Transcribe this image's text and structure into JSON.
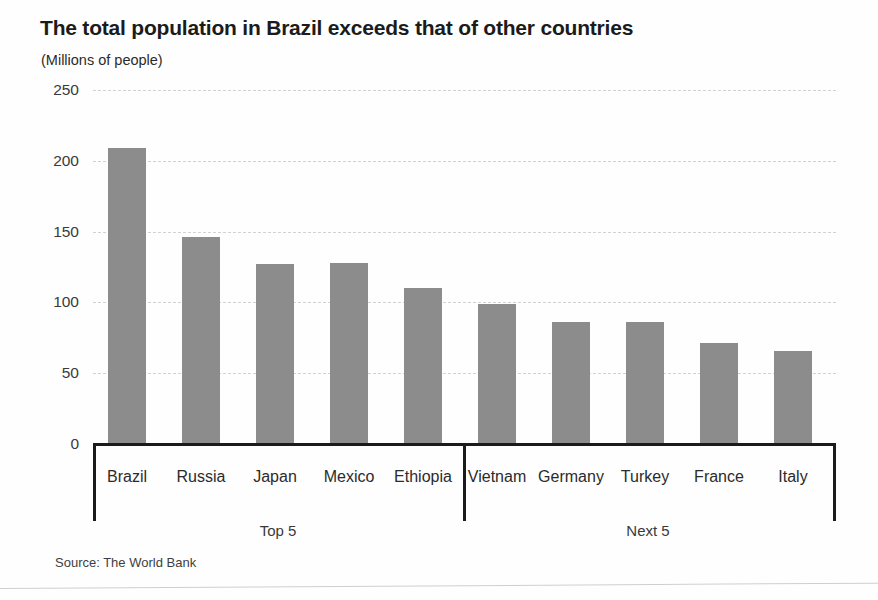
{
  "header": {
    "title": "The total population in Brazil exceeds that of other countries",
    "subtitle": "(Millions of people)"
  },
  "footer": {
    "source": "Source: The World Bank"
  },
  "groups": [
    {
      "label": "Top 5",
      "start_index": 0,
      "end_index": 4
    },
    {
      "label": "Next 5",
      "start_index": 5,
      "end_index": 9
    }
  ],
  "style": {
    "bar_color": "#8c8c8c",
    "axis_color": "#1b1b1b",
    "gridline_color": "#d2d2d2",
    "background": "#fefefe",
    "text_color": "#231f20"
  },
  "chart_data": {
    "type": "bar",
    "title": "The total population in Brazil exceeds that of other countries",
    "subtitle": "(Millions of people)",
    "xlabel": "",
    "ylabel": "Millions of people",
    "categories": [
      "Brazil",
      "Russia",
      "Japan",
      "Mexico",
      "Ethiopia",
      "Vietnam",
      "Germany",
      "Turkey",
      "France",
      "Italy"
    ],
    "values": [
      209,
      146,
      127,
      128,
      110,
      99,
      86,
      86,
      71,
      66
    ],
    "ylim": [
      0,
      250
    ],
    "yticks": [
      0,
      50,
      100,
      150,
      200,
      250
    ],
    "ytick_labels": [
      "0",
      "50",
      "100",
      "150",
      "200",
      "250"
    ],
    "grid": true,
    "grid_style": "dashed-horizontal",
    "legend": "none",
    "series": [
      {
        "name": "Total population",
        "values": [
          209,
          146,
          127,
          128,
          110,
          99,
          86,
          86,
          71,
          66
        ]
      }
    ],
    "annotations": [
      "Top 5",
      "Next 5"
    ],
    "source": "Source: The World Bank"
  }
}
